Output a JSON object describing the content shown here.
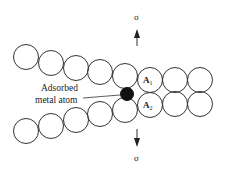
{
  "diagram": {
    "title": "",
    "labels": {
      "adsorbed_line1": "Adsorbed",
      "adsorbed_line2": "metal atom",
      "atom_a1": "A",
      "atom_a1_sub": "1",
      "atom_a2": "A",
      "atom_a2_sub": "2",
      "stress_top": "σ",
      "stress_bottom": "σ"
    },
    "colors": {
      "stroke": "#333333",
      "adsorbed_atom_fill": "#111111",
      "background": "#ffffff"
    },
    "atom_radius": 12.5,
    "top_row": [
      {
        "cx": 26,
        "cy": 57
      },
      {
        "cx": 51,
        "cy": 63
      },
      {
        "cx": 76,
        "cy": 68
      },
      {
        "cx": 100,
        "cy": 72
      },
      {
        "cx": 125,
        "cy": 76
      },
      {
        "cx": 150,
        "cy": 80,
        "label": "A1"
      },
      {
        "cx": 175,
        "cy": 80
      },
      {
        "cx": 200,
        "cy": 80
      }
    ],
    "bottom_row": [
      {
        "cx": 26,
        "cy": 131
      },
      {
        "cx": 51,
        "cy": 126
      },
      {
        "cx": 76,
        "cy": 120
      },
      {
        "cx": 100,
        "cy": 114
      },
      {
        "cx": 125,
        "cy": 110
      },
      {
        "cx": 150,
        "cy": 105,
        "label": "A2"
      },
      {
        "cx": 175,
        "cy": 104
      },
      {
        "cx": 200,
        "cy": 104
      }
    ],
    "adsorbed_atom": {
      "cx": 127,
      "cy": 94,
      "r": 6.5
    }
  }
}
